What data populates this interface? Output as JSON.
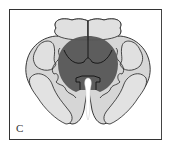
{
  "figure": {
    "panel_label": "C",
    "colors": {
      "background": "#ffffff",
      "frame": "#333333",
      "tissue_light": "#d4d4d4",
      "tissue_lighter": "#e2e2e2",
      "lesion_dark": "#555555",
      "outline": "#222222",
      "canal": "#ffffff"
    }
  }
}
